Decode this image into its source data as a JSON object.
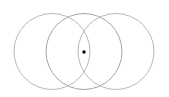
{
  "figure": {
    "canvas": {
      "width": 169,
      "height": 97,
      "background_color": "#ffffff"
    },
    "style": {
      "stroke_color": "#a8a8a8",
      "stroke_width": 0.8,
      "dot_color": "#000000"
    },
    "shapes": [
      {
        "name": "left-circle",
        "type": "circle",
        "cx": 52,
        "cy": 51.5,
        "r": 38,
        "stroke": "#a8a8a8",
        "stroke_width": 0.8,
        "fill": "none"
      },
      {
        "name": "middle-circle",
        "type": "circle",
        "cx": 84,
        "cy": 51.5,
        "r": 38,
        "stroke": "#9a9a9a",
        "stroke_width": 0.9,
        "fill": "none"
      },
      {
        "name": "right-circle",
        "type": "circle",
        "cx": 116,
        "cy": 51.5,
        "r": 38,
        "stroke": "#a8a8a8",
        "stroke_width": 0.8,
        "fill": "none"
      },
      {
        "name": "center-point",
        "type": "point",
        "cx": 84,
        "cy": 52,
        "r": 1.7,
        "fill": "#000000"
      }
    ],
    "labels": []
  }
}
